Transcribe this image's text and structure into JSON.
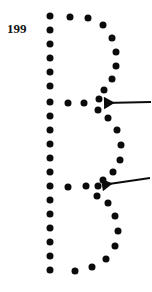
{
  "figure": {
    "number_label": "199",
    "caption": "",
    "letter_depicted": "B",
    "ink_color": "#0b0b0b",
    "background_color": "#ffffff",
    "width": 152,
    "height": 292
  },
  "chart_data": {
    "type": "scatter",
    "title": "199",
    "xlabel": "",
    "ylabel": "",
    "xlim": [
      0,
      152
    ],
    "ylim": [
      292,
      0
    ],
    "grid": false,
    "legend": null,
    "series": [
      {
        "name": "left-stem",
        "marker": "circle",
        "color": "#0b0b0b",
        "points": [
          [
            50,
            16
          ],
          [
            50,
            30
          ],
          [
            50,
            44
          ],
          [
            50,
            58
          ],
          [
            50,
            72
          ],
          [
            50,
            86
          ],
          [
            50,
            102
          ],
          [
            50,
            116
          ],
          [
            50,
            130
          ],
          [
            50,
            144
          ],
          [
            50,
            158
          ],
          [
            50,
            172
          ],
          [
            50,
            186
          ],
          [
            50,
            200
          ],
          [
            50,
            214
          ],
          [
            50,
            228
          ],
          [
            50,
            242
          ],
          [
            50,
            256
          ],
          [
            50,
            270
          ]
        ]
      },
      {
        "name": "top-bar",
        "marker": "circle",
        "color": "#0b0b0b",
        "points": [
          [
            50,
            16
          ],
          [
            70,
            17
          ],
          [
            88,
            18
          ]
        ]
      },
      {
        "name": "upper-bowl-right",
        "marker": "circle",
        "color": "#0b0b0b",
        "points": [
          [
            88,
            18
          ],
          [
            103,
            25
          ],
          [
            112,
            38
          ],
          [
            116,
            52
          ],
          [
            116,
            66
          ],
          [
            112,
            79
          ],
          [
            104,
            90
          ],
          [
            99,
            99
          ]
        ]
      },
      {
        "name": "middle-bar",
        "marker": "circle",
        "color": "#0b0b0b",
        "points": [
          [
            50,
            102
          ],
          [
            68,
            103
          ],
          [
            84,
            103
          ],
          [
            99,
            99
          ],
          [
            98,
            110
          ]
        ]
      },
      {
        "name": "lower-bowl-right",
        "marker": "circle",
        "color": "#0b0b0b",
        "points": [
          [
            98,
            110
          ],
          [
            108,
            118
          ],
          [
            117,
            130
          ],
          [
            121,
            145
          ],
          [
            120,
            160
          ],
          [
            113,
            172
          ],
          [
            103,
            180
          ],
          [
            98,
            186
          ]
        ]
      },
      {
        "name": "lower-bar",
        "marker": "circle",
        "color": "#0b0b0b",
        "points": [
          [
            50,
            186
          ],
          [
            68,
            187
          ],
          [
            86,
            186
          ],
          [
            98,
            186
          ],
          [
            97,
            196
          ]
        ]
      },
      {
        "name": "bottom-bowl-right",
        "marker": "circle",
        "color": "#0b0b0b",
        "points": [
          [
            97,
            196
          ],
          [
            108,
            203
          ],
          [
            115,
            216
          ],
          [
            118,
            231
          ],
          [
            115,
            246
          ],
          [
            106,
            259
          ],
          [
            92,
            267
          ],
          [
            75,
            271
          ],
          [
            50,
            270
          ]
        ]
      }
    ],
    "annotations": [
      {
        "name": "arrow-upper-junction",
        "type": "arrow",
        "label": "",
        "direction": "left",
        "tip": [
          104,
          103
        ],
        "tail": [
          151,
          102
        ],
        "color": "#0b0b0b"
      },
      {
        "name": "arrow-lower-junction",
        "type": "arrow",
        "label": "",
        "direction": "left",
        "tip": [
          102,
          185
        ],
        "tail": [
          150,
          178
        ],
        "color": "#0b0b0b"
      }
    ]
  }
}
